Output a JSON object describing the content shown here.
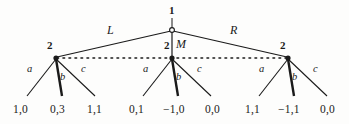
{
  "figure": {
    "type": "extensive-form-game-tree",
    "background_color": "#fdfdfc",
    "ink_color": "#1a1a1a"
  },
  "root": {
    "player_label": "1",
    "node_style": "open-circle",
    "x": 172,
    "y": 30,
    "label_x": 172,
    "label_y": 12
  },
  "first_moves": [
    {
      "label": "L",
      "x": 112,
      "y": 31,
      "target_index": 0
    },
    {
      "label": "M",
      "x": 180,
      "y": 44,
      "target_index": 1
    },
    {
      "label": "R",
      "x": 235,
      "y": 31,
      "target_index": 2
    }
  ],
  "information_set": {
    "player_label": "2",
    "line_style": "dotted",
    "y": 58,
    "x_start": 56,
    "x_end": 288,
    "nodes": [
      {
        "player_label": "2",
        "x": 56,
        "y": 58,
        "label_x": 51,
        "label_y": 45
      },
      {
        "player_label": "2",
        "x": 172,
        "y": 58,
        "label_x": 168,
        "label_y": 45
      },
      {
        "player_label": "2",
        "x": 288,
        "y": 58,
        "label_x": 284,
        "label_y": 45
      }
    ]
  },
  "second_moves": [
    {
      "label": "a",
      "x": 31,
      "y": 70
    },
    {
      "label": "b",
      "x": 63,
      "y": 78
    },
    {
      "label": "c",
      "x": 84,
      "y": 70
    },
    {
      "label": "a",
      "x": 147,
      "y": 70
    },
    {
      "label": "b",
      "x": 179,
      "y": 78
    },
    {
      "label": "c",
      "x": 200,
      "y": 70
    },
    {
      "label": "a",
      "x": 263,
      "y": 70
    },
    {
      "label": "b",
      "x": 295,
      "y": 78
    },
    {
      "label": "c",
      "x": 316,
      "y": 70
    }
  ],
  "leaves": [
    {
      "payoff": "1,0",
      "x": 27,
      "y": 111,
      "parent_index": 0,
      "edge": "a",
      "bold": false
    },
    {
      "payoff": "0,3",
      "x": 64,
      "y": 111,
      "parent_index": 0,
      "edge": "b",
      "bold": true
    },
    {
      "payoff": "1,1",
      "x": 101,
      "y": 111,
      "parent_index": 0,
      "edge": "c",
      "bold": false
    },
    {
      "payoff": "0,1",
      "x": 143,
      "y": 111,
      "parent_index": 1,
      "edge": "a",
      "bold": false
    },
    {
      "payoff": "−1,0",
      "x": 182,
      "y": 111,
      "parent_index": 1,
      "edge": "b",
      "bold": true
    },
    {
      "payoff": "0,0",
      "x": 217,
      "y": 111,
      "parent_index": 1,
      "edge": "c",
      "bold": false
    },
    {
      "payoff": "1,1",
      "x": 258,
      "y": 111,
      "parent_index": 2,
      "edge": "a",
      "bold": false
    },
    {
      "payoff": "−1,1",
      "x": 297,
      "y": 111,
      "parent_index": 2,
      "edge": "b",
      "bold": true
    },
    {
      "payoff": "0,0",
      "x": 332,
      "y": 111,
      "parent_index": 2,
      "edge": "c",
      "bold": false
    }
  ],
  "leaf_edge_end_y": 96,
  "leaf_edge_start_y": 60,
  "leaf_edge_targets": [
    27,
    64,
    101,
    143,
    182,
    217,
    258,
    297,
    332
  ]
}
